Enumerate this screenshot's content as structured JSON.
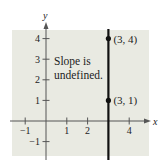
{
  "chart_data": {
    "type": "line",
    "title": "",
    "xlabel": "x",
    "ylabel": "y",
    "xlim": [
      -1.6,
      4.5
    ],
    "ylim": [
      -1.7,
      4.5
    ],
    "grid": false,
    "background": "#e9eae2",
    "line_color": "#111111",
    "x_ticks": [
      {
        "value": -1,
        "label": "−1"
      },
      {
        "value": 1,
        "label": "1"
      },
      {
        "value": 2,
        "label": "2"
      },
      {
        "value": 4,
        "label": "4"
      }
    ],
    "y_ticks": [
      {
        "value": -1,
        "label": "−1"
      },
      {
        "value": 1,
        "label": "1"
      },
      {
        "value": 2,
        "label": "2"
      },
      {
        "value": 3,
        "label": "3"
      },
      {
        "value": 4,
        "label": "4"
      }
    ],
    "series": [
      {
        "name": "vertical line x = 3",
        "type": "vertical-line",
        "x": 3
      }
    ],
    "points": [
      {
        "x": 3,
        "y": 4,
        "label": "(3, 4)"
      },
      {
        "x": 3,
        "y": 1,
        "label": "(3, 1)"
      }
    ],
    "annotations": [
      {
        "text_lines": [
          "Slope is",
          "undefined."
        ],
        "x": 0.4,
        "y": 2.6
      }
    ]
  }
}
